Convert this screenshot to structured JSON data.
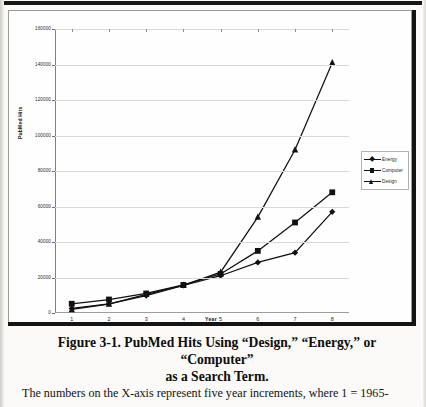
{
  "figure": {
    "caption_line1": "Figure 3-1. PubMed Hits Using “Design,” “Energy,” or “Computer”",
    "caption_line2": "as a Search Term.",
    "body_text": "The numbers on the X-axis represent five year increments, where 1 = 1965-"
  },
  "legend": {
    "items": [
      {
        "label": "Energy",
        "marker": "diamond-marker"
      },
      {
        "label": "Computer",
        "marker": "square-marker"
      },
      {
        "label": "Design",
        "marker": "triangle-marker"
      }
    ]
  },
  "chart_data": {
    "type": "line",
    "title": "",
    "xlabel": "Year",
    "ylabel": "PubMed Hits",
    "x": [
      1,
      2,
      3,
      4,
      5,
      6,
      7,
      8
    ],
    "xtick_labels": [
      "1",
      "2",
      "3",
      "4",
      "5",
      "6",
      "7",
      "8"
    ],
    "ytick_labels": [
      "0",
      "20000",
      "40000",
      "60000",
      "80000",
      "100000",
      "120000",
      "140000",
      "160000"
    ],
    "yticks": [
      0,
      20000,
      40000,
      60000,
      80000,
      100000,
      120000,
      140000,
      160000
    ],
    "ylim": [
      0,
      160000
    ],
    "xlim": [
      0.55,
      8.45
    ],
    "grid": "horizontal",
    "legend_position": "right",
    "series": [
      {
        "name": "Energy",
        "marker": "diamond",
        "values": [
          2600,
          5200,
          9800,
          15500,
          21000,
          28500,
          34000,
          57000
        ]
      },
      {
        "name": "Computer",
        "marker": "square",
        "values": [
          5200,
          7600,
          11000,
          15800,
          22000,
          35000,
          51000,
          68000
        ]
      },
      {
        "name": "Design",
        "marker": "triangle",
        "values": [
          2000,
          5000,
          10500,
          15600,
          23000,
          54000,
          92000,
          141000
        ]
      }
    ]
  }
}
